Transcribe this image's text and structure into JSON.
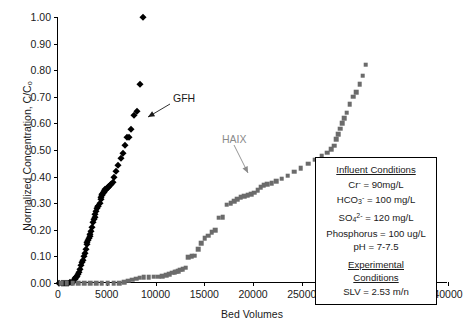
{
  "chart_data": {
    "type": "scatter",
    "title": "",
    "xlabel": "Bed Volumes",
    "ylabel": "Normalized Concentration, C/Cₒ",
    "xlim": [
      0,
      40000
    ],
    "ylim": [
      0,
      1.0
    ],
    "xticks": [
      0,
      5000,
      10000,
      15000,
      20000,
      25000,
      30000,
      35000,
      40000
    ],
    "xtick_labels": [
      "0",
      "5000",
      "10000",
      "15000",
      "20000",
      "25000",
      "30000",
      "35000",
      "40000"
    ],
    "yticks": [
      0.0,
      0.1,
      0.2,
      0.3,
      0.4,
      0.5,
      0.6,
      0.7,
      0.8,
      0.9,
      1.0
    ],
    "ytick_labels": [
      "0.00",
      "0.10",
      "0.20",
      "0.30",
      "0.40",
      "0.50",
      "0.60",
      "0.70",
      "0.80",
      "0.90",
      "1.00"
    ],
    "grid": false,
    "legend": "none",
    "series": [
      {
        "name": "GFH",
        "marker": "diamond",
        "color": "#000000",
        "points": [
          [
            150,
            0.0
          ],
          [
            380,
            0.0
          ],
          [
            600,
            0.0
          ],
          [
            820,
            0.0
          ],
          [
            1050,
            0.0
          ],
          [
            1280,
            0.002
          ],
          [
            1450,
            0.004
          ],
          [
            1600,
            0.008
          ],
          [
            1700,
            0.014
          ],
          [
            1760,
            0.02
          ],
          [
            1820,
            0.024
          ],
          [
            1880,
            0.022
          ],
          [
            1950,
            0.026
          ],
          [
            2050,
            0.032
          ],
          [
            2150,
            0.04
          ],
          [
            2260,
            0.052
          ],
          [
            2380,
            0.068
          ],
          [
            2480,
            0.078
          ],
          [
            2560,
            0.088
          ],
          [
            2650,
            0.1
          ],
          [
            2760,
            0.112
          ],
          [
            2860,
            0.128
          ],
          [
            2960,
            0.148
          ],
          [
            3020,
            0.155
          ],
          [
            3090,
            0.16
          ],
          [
            3170,
            0.168
          ],
          [
            3260,
            0.176
          ],
          [
            3330,
            0.186
          ],
          [
            3420,
            0.196
          ],
          [
            3520,
            0.212
          ],
          [
            3620,
            0.228
          ],
          [
            3700,
            0.24
          ],
          [
            3760,
            0.248
          ],
          [
            3830,
            0.258
          ],
          [
            3920,
            0.272
          ],
          [
            4000,
            0.282
          ],
          [
            4080,
            0.29
          ],
          [
            4150,
            0.288
          ],
          [
            4260,
            0.3
          ],
          [
            4360,
            0.314
          ],
          [
            4430,
            0.322
          ],
          [
            4500,
            0.33
          ],
          [
            4560,
            0.334
          ],
          [
            4620,
            0.338
          ],
          [
            4680,
            0.342
          ],
          [
            4740,
            0.346
          ],
          [
            4800,
            0.35
          ],
          [
            4860,
            0.352
          ],
          [
            4920,
            0.354
          ],
          [
            4980,
            0.356
          ],
          [
            5040,
            0.358
          ],
          [
            5100,
            0.36
          ],
          [
            5170,
            0.362
          ],
          [
            5250,
            0.364
          ],
          [
            5340,
            0.368
          ],
          [
            5450,
            0.372
          ],
          [
            5600,
            0.38
          ],
          [
            5780,
            0.398
          ],
          [
            5980,
            0.42
          ],
          [
            6200,
            0.444
          ],
          [
            6420,
            0.47
          ],
          [
            6620,
            0.49
          ],
          [
            6850,
            0.52
          ],
          [
            7050,
            0.548
          ],
          [
            7280,
            0.548
          ],
          [
            7520,
            0.58
          ],
          [
            7780,
            0.63
          ],
          [
            8150,
            0.645
          ],
          [
            8400,
            0.748
          ],
          [
            8700,
            1.0
          ]
        ]
      },
      {
        "name": "HAIX",
        "marker": "square",
        "color": "#6b6b6b",
        "points": [
          [
            300,
            0.0
          ],
          [
            900,
            0.0
          ],
          [
            1500,
            0.0
          ],
          [
            2100,
            0.0
          ],
          [
            2700,
            0.0
          ],
          [
            3300,
            0.0
          ],
          [
            3900,
            0.0
          ],
          [
            4500,
            0.0
          ],
          [
            5100,
            0.0
          ],
          [
            5700,
            0.0
          ],
          [
            6300,
            0.0
          ],
          [
            6800,
            0.004
          ],
          [
            7200,
            0.008
          ],
          [
            7600,
            0.012
          ],
          [
            8000,
            0.016
          ],
          [
            8400,
            0.02
          ],
          [
            8800,
            0.022
          ],
          [
            9300,
            0.022
          ],
          [
            9800,
            0.024
          ],
          [
            10300,
            0.024
          ],
          [
            10700,
            0.026
          ],
          [
            11100,
            0.03
          ],
          [
            11400,
            0.034
          ],
          [
            11700,
            0.038
          ],
          [
            11950,
            0.04
          ],
          [
            12150,
            0.042
          ],
          [
            12350,
            0.044
          ],
          [
            12550,
            0.05
          ],
          [
            12800,
            0.052
          ],
          [
            13100,
            0.058
          ],
          [
            13350,
            0.098
          ],
          [
            13700,
            0.1
          ],
          [
            14000,
            0.102
          ],
          [
            14350,
            0.126
          ],
          [
            14700,
            0.15
          ],
          [
            15050,
            0.168
          ],
          [
            15400,
            0.178
          ],
          [
            15750,
            0.19
          ],
          [
            16100,
            0.198
          ],
          [
            16500,
            0.246
          ],
          [
            16900,
            0.248
          ],
          [
            17300,
            0.294
          ],
          [
            17700,
            0.3
          ],
          [
            18050,
            0.308
          ],
          [
            18400,
            0.316
          ],
          [
            18750,
            0.322
          ],
          [
            19100,
            0.326
          ],
          [
            19450,
            0.33
          ],
          [
            19800,
            0.334
          ],
          [
            20150,
            0.34
          ],
          [
            20500,
            0.348
          ],
          [
            20800,
            0.36
          ],
          [
            21100,
            0.368
          ],
          [
            21450,
            0.372
          ],
          [
            21900,
            0.376
          ],
          [
            22400,
            0.382
          ],
          [
            22950,
            0.392
          ],
          [
            23550,
            0.404
          ],
          [
            24200,
            0.418
          ],
          [
            24900,
            0.432
          ],
          [
            25650,
            0.448
          ],
          [
            26400,
            0.464
          ],
          [
            27050,
            0.478
          ],
          [
            27600,
            0.49
          ],
          [
            28000,
            0.502
          ],
          [
            28300,
            0.516
          ],
          [
            28550,
            0.54
          ],
          [
            28750,
            0.56
          ],
          [
            28950,
            0.58
          ],
          [
            29150,
            0.6
          ],
          [
            29350,
            0.62
          ],
          [
            29600,
            0.64
          ],
          [
            29900,
            0.672
          ],
          [
            30300,
            0.7
          ],
          [
            30600,
            0.718
          ],
          [
            30950,
            0.748
          ],
          [
            31250,
            0.78
          ],
          [
            31550,
            0.82
          ]
        ]
      }
    ],
    "annotations": [
      {
        "text": "GFH",
        "color": "#1a1a1a",
        "label_x": 173,
        "label_y": 92,
        "arrow_from": [
          170,
          104
        ],
        "arrow_to": [
          148,
          117
        ]
      },
      {
        "text": "HAIX",
        "color": "#8a8a8a",
        "label_x": 222,
        "label_y": 133,
        "arrow_from": [
          234,
          145
        ],
        "arrow_to": [
          248,
          173
        ]
      }
    ]
  },
  "info_box": {
    "influent_header": "Influent Conditions",
    "influent_rows": [
      {
        "id": "cr",
        "prefix": "Cr",
        "sup": "-",
        "sub": "",
        "value": " = 90mg/L"
      },
      {
        "id": "hco3",
        "prefix": "HCO",
        "sup": "-",
        "sub": "3",
        "value": " = 100 mg/L"
      },
      {
        "id": "so4",
        "prefix": "SO",
        "sup": "2-",
        "sub": "4",
        "value": " = 120 mg/L"
      },
      {
        "id": "phosphorus",
        "prefix": "Phosphorus",
        "sup": "",
        "sub": "",
        "value": " = 100 ug/L"
      },
      {
        "id": "ph",
        "prefix": "pH",
        "sup": "",
        "sub": "",
        "value": " = 7-7.5"
      }
    ],
    "experimental_header_line1": "Experimental",
    "experimental_header_line2": "Conditions",
    "slv": "SLV = 2.53 m/n"
  }
}
